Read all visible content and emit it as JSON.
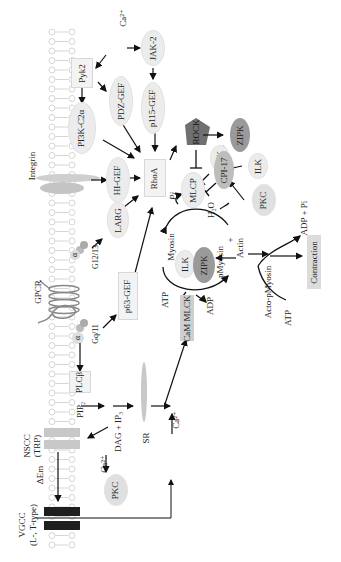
{
  "diagram": {
    "orientation": "rotated -90deg",
    "colors": {
      "membrane": "#d6d6d6",
      "node_light": "#ececec",
      "node_dark": "#9a9a9a",
      "rock": "#707070",
      "channel_dark": "#1e1e1e",
      "channel_light": "#c8c8c8",
      "arrow": "#111111"
    },
    "membrane": {
      "labels": {
        "integrin": "Integrin",
        "gpcr": "GPCR",
        "nscc": "NSCC",
        "trp": "(TRP)",
        "delta_em": "ΔEm",
        "vgcc": "VGCC",
        "vgcc_types": "(L-, T-type)"
      },
      "g_proteins": {
        "alpha": "α",
        "beta": "β",
        "gamma": "γ",
        "g1213": "G12/13",
        "gq11": "Gq/11"
      }
    },
    "nodes": {
      "ca_top": "Ca²⁺",
      "pyk2": "Pyk2",
      "jak2": "JAK-2",
      "pdz_gef": "PDZ-GEF",
      "p115_gef": "p115-GEF",
      "pi3k": "PI3K-C2α",
      "hi_gef": "HI-GEF",
      "larg": "LARG",
      "rhoa": "RhoA",
      "rock": "ROCK",
      "zipk_top": "ZIPK",
      "ilk_a": "ILK",
      "ilk_b": "ILK",
      "cpi17": "CPI-17",
      "pkc_right": "PKC",
      "mlcp": "MLCP",
      "pi": "Pi",
      "h2o": "H₂O",
      "myosin": "Myosin",
      "pmyosin": "pMyosin",
      "plus": "+",
      "actin": "Actin",
      "ilk_c": "ILK",
      "zipk_mid": "ZIPK",
      "atp_left": "ATP",
      "adp": "ADP",
      "cam_mlck": "CaM MLCK",
      "p63_gef": "p63-GEF",
      "acto_pmyosin": "Acto-pMyosin",
      "adp_pi": "ADP + Pi",
      "atp_right": "ATP",
      "contraction": "Contraction",
      "plcb": "PLCβ",
      "pip2": "PIP₂",
      "dag_ip3": "DAG + IP₃",
      "sr": "SR",
      "ca_mid": "Ca²⁺",
      "ca_low": "Ca²⁺",
      "pkc_low": "PKC"
    }
  }
}
